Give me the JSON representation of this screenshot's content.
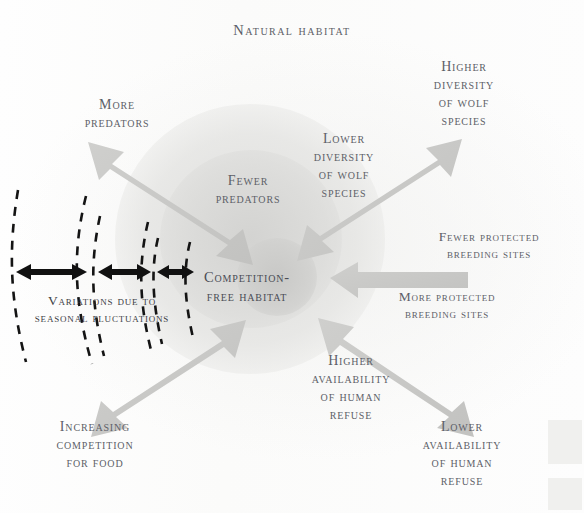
{
  "title": "Natural habitat",
  "center": {
    "label": "Competition-\nfree habitat"
  },
  "labels": {
    "more_predators": "More\npredators",
    "fewer_predators": "Fewer\npredators",
    "lower_diversity": "Lower\ndiversity\nof wolf\nspecies",
    "higher_diversity": "Higher\ndiversity\nof wolf\nspecies",
    "fewer_breeding": "Fewer protected\nbreeding sites",
    "more_breeding": "More protected\nbreeding sites",
    "higher_availability": "Higher\navailability\nof human\nrefuse",
    "lower_availability": "Lower\navailability\nof human\nrefuse",
    "increasing_competition": "Increasing\ncompetition\nfor food",
    "variations": "Variations due to\nseasonal fluctuations"
  },
  "colors": {
    "arrow_gray": "#c9c9c7",
    "arrow_gray_dark": "#bdbdbb",
    "text_gray": "#5d5f68",
    "text_dark": "#3c3e45",
    "dash_black": "#131313",
    "halo_outer": "#ddddd9",
    "halo_inner": "#c7c7c5",
    "paper": "#fdfdfc"
  },
  "arrows": [
    {
      "name": "more-predators-to-fewer-predators",
      "kind": "double",
      "from": "upper-left",
      "to": "center"
    },
    {
      "name": "higher-diversity-to-lower-diversity",
      "kind": "double",
      "from": "upper-right",
      "to": "center"
    },
    {
      "name": "fewer-breeding-to-more-breeding",
      "kind": "single",
      "from": "right",
      "to": "center"
    },
    {
      "name": "lower-availability-to-higher-availability",
      "kind": "double",
      "from": "lower-right",
      "to": "center"
    },
    {
      "name": "increasing-competition-to-center",
      "kind": "double",
      "from": "lower-left",
      "to": "center"
    }
  ],
  "fluctuation_bands": [
    {
      "name": "band-1",
      "gap_arrow": "double-headed"
    },
    {
      "name": "band-2",
      "gap_arrow": "double-headed"
    },
    {
      "name": "band-3",
      "gap_arrow": "double-headed"
    }
  ]
}
